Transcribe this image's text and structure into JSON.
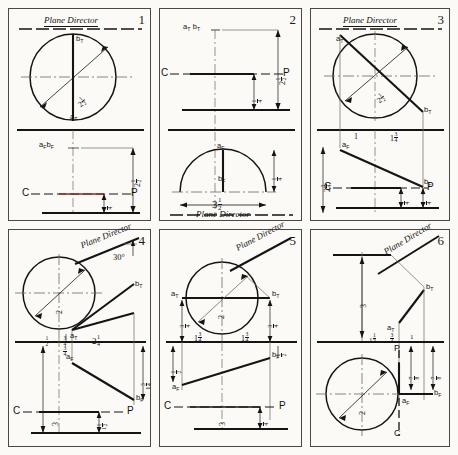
{
  "sheet": {
    "title_text_repeated": "Plane Director",
    "panels": [
      {
        "number": "1",
        "plane_director_label": "Plane Director",
        "point_labels": [
          "b_T",
          "a_T",
          "a_F b_F"
        ],
        "dimensions": [
          "2 1/2",
          "2 1/2",
          "1/4"
        ],
        "reference_line_labels": [
          "C",
          "P"
        ],
        "circle_radius_label": "2 1/2"
      },
      {
        "number": "2",
        "plane_director_label": "Plane Director",
        "point_labels": [
          "a_T b_T",
          "a_F",
          "b_F"
        ],
        "dimensions": [
          "2 1/2",
          "1/4",
          "3 1/2",
          "1/4"
        ],
        "reference_line_labels": [
          "C",
          "P"
        ]
      },
      {
        "number": "3",
        "plane_director_label": "Plane Director",
        "point_labels": [
          "a_T",
          "b_T",
          "a_F",
          "b_F"
        ],
        "dimensions": [
          "2 1/2",
          "1",
          "1 3/4",
          "2 3/4",
          "1/4",
          "1/4"
        ],
        "reference_line_labels": [
          "C",
          "P"
        ],
        "circle_radius_label": "2 1/2"
      },
      {
        "number": "4",
        "plane_director_label": "Plane Director",
        "angle_label": "30°",
        "point_labels": [
          "b_T",
          "a_T",
          "a_F",
          "b_F"
        ],
        "dimensions": [
          "2",
          "2",
          "1/2",
          "3/4",
          "2 1/4",
          "3/4",
          "1 3/4",
          "3",
          "1 1/2"
        ],
        "reference_line_labels": [
          "C",
          "P"
        ],
        "circle_radius_label": "2"
      },
      {
        "number": "5",
        "plane_director_label": "Plane Director",
        "point_labels": [
          "a_T",
          "b_T",
          "a_F",
          "b_F"
        ],
        "dimensions": [
          "2",
          "3/4",
          "3/4",
          "1 3/4",
          "1 3/4",
          "1/2",
          "1/2",
          "3",
          "1/4"
        ],
        "reference_line_labels": [
          "C",
          "P"
        ],
        "circle_radius_label": "2"
      },
      {
        "number": "6",
        "plane_director_label": "Plane Director",
        "point_labels": [
          "b_T",
          "a_T",
          "a_F",
          "b_F",
          "C",
          "P"
        ],
        "dimensions": [
          "3",
          "1 1/2",
          "3/4",
          "1",
          "7/8",
          "7/8",
          "2"
        ],
        "circle_radius_label": "2"
      }
    ]
  }
}
